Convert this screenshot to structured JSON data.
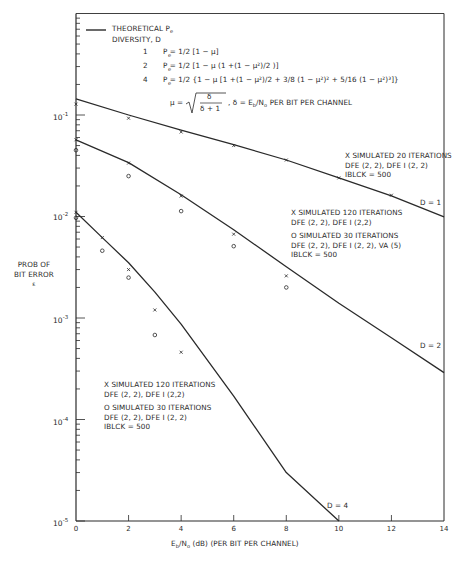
{
  "chart_data": {
    "type": "line",
    "title": "",
    "xlabel": "Eb/No (dB)  (PER BIT PER CHANNEL)",
    "ylabel": "PROB OF BIT ERROR",
    "ylabel_symbol": "ε",
    "yscale": "log",
    "xlim": [
      0,
      14
    ],
    "ylim": [
      1e-05,
      1
    ],
    "x_ticks": [
      0,
      2,
      4,
      6,
      8,
      10,
      12,
      14
    ],
    "y_ticks": [
      "10^-1",
      "10^-2",
      "10^-3",
      "10^-4",
      "10^-5"
    ],
    "grid": false,
    "legend": {
      "line_label_1": "THEORETICAL P",
      "line_label_1_sub": "e",
      "line_label_2": "DIVERSITY, D",
      "formulas": [
        {
          "d": "1",
          "text": "Pe = 1/2  [1 − μ]"
        },
        {
          "d": "2",
          "text": "Pe = 1/2  [1 − μ (1 + (1 − μ²)/2 )]"
        },
        {
          "d": "4",
          "text": "Pe = 1/2  {1 − μ [1 + (1 − μ²)/2  + 3/8 (1 − μ²)² + 5/16 (1 − μ²)³]}"
        }
      ],
      "mu_def": "μ = √( δ / (δ + 1) ) ,  δ = Eb/No PER BIT PER CHANNEL"
    },
    "series": [
      {
        "name": "Theoretical D = 1",
        "style": "line",
        "x": [
          0,
          2,
          4,
          6,
          8,
          10,
          12,
          14
        ],
        "values": [
          0.144,
          0.1,
          0.071,
          0.051,
          0.036,
          0.024,
          0.016,
          0.0099
        ]
      },
      {
        "name": "Theoretical D = 2",
        "style": "line",
        "x": [
          0,
          2,
          4,
          6,
          8,
          10,
          12,
          14
        ],
        "values": [
          0.057,
          0.034,
          0.0164,
          0.0074,
          0.0032,
          0.0014,
          0.00064,
          0.00029
        ]
      },
      {
        "name": "Theoretical D = 4",
        "style": "line",
        "x": [
          0,
          1,
          2,
          3,
          4,
          6,
          8,
          10
        ],
        "values": [
          0.011,
          0.0062,
          0.0035,
          0.0018,
          0.00087,
          0.00017,
          3e-05,
          1e-05
        ]
      },
      {
        "name": "D=1 X simulated 20 iterations",
        "style": "x",
        "x": [
          0,
          2,
          4,
          6,
          8,
          10,
          12
        ],
        "values": [
          0.128,
          0.093,
          0.068,
          0.05,
          0.036,
          0.024,
          0.0162
        ]
      },
      {
        "name": "D=2 X simulated 120 iterations",
        "style": "x",
        "x": [
          0,
          2,
          4,
          6,
          8
        ],
        "values": [
          0.057,
          0.0336,
          0.0159,
          0.0067,
          0.0026
        ]
      },
      {
        "name": "D=2 O simulated 30 iterations",
        "style": "o",
        "x": [
          0,
          2,
          4,
          6,
          8
        ],
        "values": [
          0.045,
          0.025,
          0.0113,
          0.0051,
          0.002
        ]
      },
      {
        "name": "D=4 X simulated 120 iterations",
        "style": "x",
        "x": [
          0,
          1,
          2,
          3,
          4
        ],
        "values": [
          0.011,
          0.0062,
          0.003,
          0.0012,
          0.00046
        ]
      },
      {
        "name": "D=4 O simulated 30 iterations",
        "style": "o",
        "x": [
          0,
          1,
          2,
          3
        ],
        "values": [
          0.0097,
          0.0046,
          0.0025,
          0.00068
        ]
      }
    ],
    "annotations": [
      {
        "text": "D = 1",
        "x": 13.2,
        "y": 0.0115
      },
      {
        "text": "D = 2",
        "x": 13.2,
        "y": 0.00045
      },
      {
        "text": "D = 4",
        "x": 9.7,
        "y": 1.4e-05
      }
    ]
  },
  "ui": {
    "y_tick_labels": [
      {
        "base": "10",
        "exp": "-1"
      },
      {
        "base": "10",
        "exp": "-2"
      },
      {
        "base": "10",
        "exp": "-3"
      },
      {
        "base": "10",
        "exp": "-4"
      },
      {
        "base": "10",
        "exp": "-5"
      }
    ],
    "x_tick_labels": [
      "0",
      "2",
      "4",
      "6",
      "8",
      "10",
      "12",
      "14"
    ],
    "ylabel_line1": "PROB OF",
    "ylabel_line2": "BIT ERROR",
    "ylabel_symbol": "ε",
    "xlabel_main": "E",
    "xlabel_sub_b": "b",
    "xlabel_slash": "/N",
    "xlabel_sub_o": "o",
    "xlabel_rest": " (dB)   (PER BIT PER CHANNEL)",
    "legend_title_1": "THEORETICAL P",
    "legend_title_sub": "e",
    "legend_title_2": "DIVERSITY, D",
    "formula_numbers": [
      "1",
      "2",
      "4"
    ],
    "formula_1": "P  = 1/2  [1 − μ]",
    "formula_2": "P  = 1/2  [1 − μ (1 +(1 − μ²)/2 )]",
    "formula_4": "P  = 1/2  {1 − μ [1 +(1 − μ²)/2  + 3/8 (1 − μ²)² + 5/16 (1 − μ²)³]}",
    "mu_left": "μ =",
    "mu_num": "δ",
    "mu_den": "δ + 1",
    "mu_right": ", δ = E",
    "mu_right_b": "b",
    "mu_right_n": "/N",
    "mu_right_o": "o",
    "mu_right_rest": " PER BIT PER CHANNEL",
    "block_d1": [
      "X SIMULATED 20 ITERATIONS",
      "DFE (2, 2), DFE I (2, 2)",
      "IBLCK = 500"
    ],
    "block_d2": [
      "X SIMULATED 120 ITERATIONS",
      "DFE (2, 2),  DFE I (2,2)",
      "",
      "O SIMULATED 30 ITERATIONS",
      "DFE (2, 2), DFE I (2, 2), VA (5)",
      "IBLCK = 500"
    ],
    "block_d4": [
      "X SIMULATED 120 ITERATIONS",
      "DFE (2, 2),  DFE I (2,2)",
      "",
      "O SIMULATED 30 ITERATIONS",
      "DFE (2, 2), DFE I (2, 2)",
      "IBLCK = 500"
    ],
    "label_d1": "D = 1",
    "label_d2": "D = 2",
    "label_d4": "D = 4"
  }
}
